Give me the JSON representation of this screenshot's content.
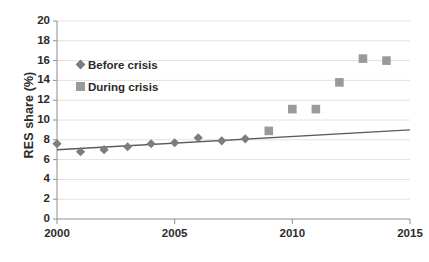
{
  "chart_data": {
    "type": "scatter",
    "title": "",
    "xlabel": "",
    "ylabel": "RES share (%)",
    "xlim": [
      2000,
      2015
    ],
    "ylim": [
      0,
      20
    ],
    "xticks": [
      2000,
      2005,
      2010,
      2015
    ],
    "yticks": [
      0,
      2,
      4,
      6,
      8,
      10,
      12,
      14,
      16,
      18,
      20
    ],
    "grid": "horizontal",
    "legend_position": "upper-left-inside",
    "series": [
      {
        "name": "Before crisis",
        "marker": "diamond",
        "color": "#7d7d7d",
        "x": [
          2000,
          2001,
          2002,
          2003,
          2004,
          2005,
          2006,
          2007,
          2008
        ],
        "values": [
          7.6,
          6.8,
          7.0,
          7.3,
          7.6,
          7.7,
          8.2,
          7.9,
          8.1
        ]
      },
      {
        "name": "During crisis",
        "marker": "square",
        "color": "#9a9a9a",
        "x": [
          2009,
          2010,
          2011,
          2012,
          2013,
          2014
        ],
        "values": [
          8.9,
          11.1,
          11.1,
          13.8,
          16.2,
          16.0
        ]
      }
    ],
    "trendline": {
      "name": "linear trend",
      "color": "#5a5a5a",
      "x": [
        2000,
        2015
      ],
      "values": [
        7.0,
        9.0
      ]
    }
  },
  "axes": {
    "y_title": "RES share (%)",
    "y_tick_labels": [
      "20",
      "18",
      "16",
      "14",
      "12",
      "10",
      "8",
      "6",
      "4",
      "2",
      "0"
    ],
    "x_tick_labels": [
      "2000",
      "2005",
      "2010",
      "2015"
    ]
  },
  "legend": {
    "items": [
      {
        "label": "Before crisis",
        "marker": "diamond-marker-icon"
      },
      {
        "label": "During crisis",
        "marker": "square-marker-icon"
      }
    ]
  },
  "colors": {
    "axis": "#8e8e8e",
    "grid": "#e2e2e2",
    "text": "#2b2b2b",
    "diamond": "#7d7d7d",
    "square": "#9a9a9a",
    "trend": "#5a5a5a",
    "background": "#ffffff"
  }
}
